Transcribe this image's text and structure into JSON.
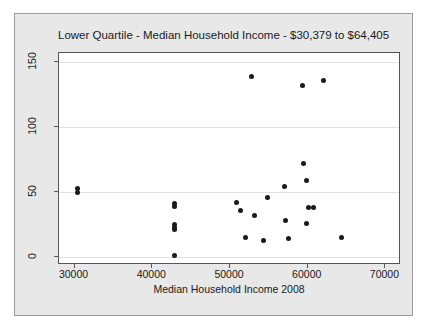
{
  "chart_data": {
    "type": "scatter",
    "title": "Lower Quartile - Median Household Income - $30,379 to $64,405",
    "xlabel": "Median Household Income 2008",
    "ylabel": "",
    "xlim": [
      28000,
      72000
    ],
    "ylim": [
      -6,
      157
    ],
    "xticks": [
      30000,
      40000,
      50000,
      60000,
      70000
    ],
    "xtick_labels": [
      "30000",
      "40000",
      "50000",
      "60000",
      "70000"
    ],
    "yticks": [
      0,
      50,
      100,
      150
    ],
    "ytick_labels": [
      "0",
      "50",
      "100",
      "150"
    ],
    "grid": true,
    "grid_axis": "y",
    "legend": "none",
    "marker": "filled-circle",
    "marker_color": "#1a1a1a",
    "points": [
      {
        "x": 30350,
        "y": 53
      },
      {
        "x": 30350,
        "y": 50
      },
      {
        "x": 42800,
        "y": 41
      },
      {
        "x": 42800,
        "y": 39
      },
      {
        "x": 42800,
        "y": 25
      },
      {
        "x": 42800,
        "y": 23
      },
      {
        "x": 42800,
        "y": 21
      },
      {
        "x": 42800,
        "y": 1
      },
      {
        "x": 50900,
        "y": 42
      },
      {
        "x": 51400,
        "y": 36
      },
      {
        "x": 52800,
        "y": 139
      },
      {
        "x": 52000,
        "y": 15
      },
      {
        "x": 53200,
        "y": 32
      },
      {
        "x": 54300,
        "y": 13
      },
      {
        "x": 54800,
        "y": 46
      },
      {
        "x": 57000,
        "y": 54
      },
      {
        "x": 57200,
        "y": 28
      },
      {
        "x": 57500,
        "y": 14
      },
      {
        "x": 59300,
        "y": 132
      },
      {
        "x": 59400,
        "y": 72
      },
      {
        "x": 59900,
        "y": 59
      },
      {
        "x": 59800,
        "y": 26
      },
      {
        "x": 60100,
        "y": 38
      },
      {
        "x": 60700,
        "y": 38
      },
      {
        "x": 62000,
        "y": 136
      },
      {
        "x": 64300,
        "y": 15
      }
    ]
  }
}
